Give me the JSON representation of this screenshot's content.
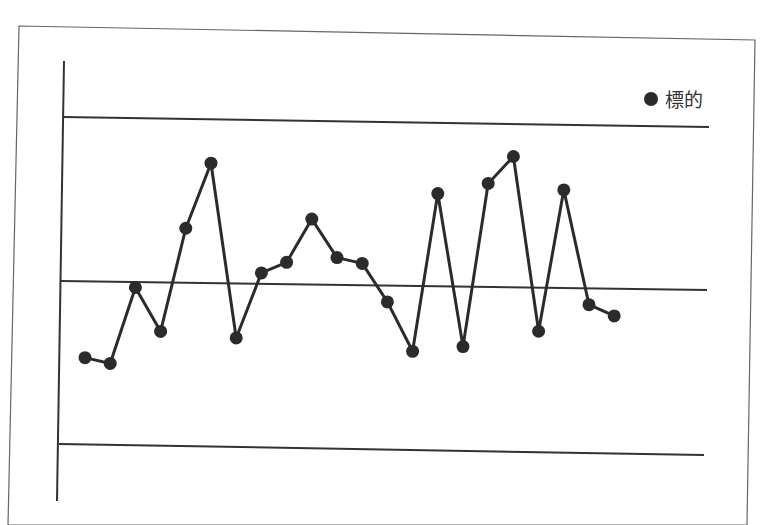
{
  "chart_data": {
    "type": "line",
    "title": "",
    "xlabel": "",
    "ylabel": "",
    "legend": {
      "position": "top-right",
      "entries": [
        "標的"
      ]
    },
    "grid": false,
    "reference_lines": [
      {
        "name": "UCL",
        "value": 3
      },
      {
        "name": "CL",
        "value": 0
      },
      {
        "name": "LCL",
        "value": -3
      }
    ],
    "ylim": [
      -4,
      4
    ],
    "x": [
      1,
      2,
      3,
      4,
      5,
      6,
      7,
      8,
      9,
      10,
      11,
      12,
      13,
      14,
      15,
      16,
      17,
      18,
      19,
      20,
      21,
      22
    ],
    "series": [
      {
        "name": "標的",
        "color": "#2b2b2b",
        "values": [
          -1.4,
          -1.5,
          -0.1,
          -0.9,
          1.0,
          2.2,
          -1.0,
          0.2,
          0.4,
          1.2,
          0.5,
          0.4,
          -0.3,
          -1.2,
          1.7,
          -1.1,
          1.9,
          2.4,
          -0.8,
          1.8,
          -0.3,
          -0.5
        ]
      }
    ]
  },
  "legend": {
    "label": "標的",
    "marker_color": "#2b2b2b"
  },
  "colors": {
    "line": "#2b2b2b",
    "frame": "#555555",
    "background": "#ffffff"
  }
}
